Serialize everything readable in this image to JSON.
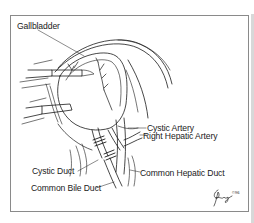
{
  "figure": {
    "type": "anatomical-illustration",
    "labels": {
      "gallbladder": "Gallbladder",
      "cystic_artery": "Cystic Artery",
      "right_hepatic_artery": "Right Hepatic Artery",
      "cystic_duct": "Cystic Duct",
      "common_bile_duct": "Common Bile Duct",
      "common_hepatic_duct": "Common Hepatic Duct"
    },
    "signature": {
      "artist_mark": "signature",
      "year": "©96"
    },
    "colors": {
      "line": "#1a1a1a",
      "frame": "#8a8a8a",
      "background": "#ffffff"
    }
  }
}
